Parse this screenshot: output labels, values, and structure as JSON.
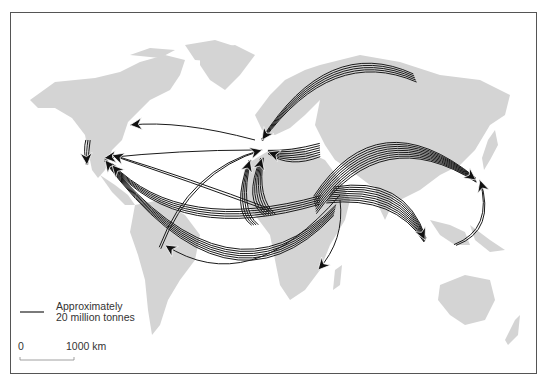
{
  "figure": {
    "type": "flow-map",
    "land_color": "#d4d4d4",
    "flow_color": "#1a1a1a",
    "frame_color": "#555555"
  },
  "legend": {
    "line_label_1": "Approximately",
    "line_label_2": "20 million tonnes",
    "tonnes_per_line": 20
  },
  "scale_bar": {
    "start_label": "0",
    "end_label": "1000 km"
  },
  "flows": [
    {
      "name": "russia-to-europe",
      "from": "Russia",
      "to": "Europe",
      "lines": 5
    },
    {
      "name": "middle-east-to-japan",
      "from": "Middle East",
      "to": "Japan",
      "lines": 9
    },
    {
      "name": "middle-east-to-southeast-asia",
      "from": "Middle East",
      "to": "Southeast Asia",
      "lines": 9
    },
    {
      "name": "middle-east-to-europe",
      "from": "Middle East",
      "to": "Europe",
      "lines": 7
    },
    {
      "name": "north-africa-to-europe",
      "from": "North Africa",
      "to": "Europe",
      "lines": 6
    },
    {
      "name": "west-africa-to-europe",
      "from": "West Africa",
      "to": "Europe",
      "lines": 4
    },
    {
      "name": "middle-east-to-usa",
      "from": "Middle East",
      "to": "USA",
      "lines": 6
    },
    {
      "name": "middle-east-to-usa-pacific",
      "from": "Middle East",
      "to": "USA",
      "lines": 5
    },
    {
      "name": "europe-to-canada",
      "from": "Europe",
      "to": "Canada",
      "lines": 1
    },
    {
      "name": "europe-to-usa",
      "from": "Europe",
      "to": "USA",
      "lines": 1
    },
    {
      "name": "west-africa-to-usa",
      "from": "West Africa",
      "to": "USA",
      "lines": 2
    },
    {
      "name": "caribbean-to-europe",
      "from": "Caribbean/South America",
      "to": "Europe",
      "lines": 2
    },
    {
      "name": "middle-east-to-brazil",
      "from": "Middle East",
      "to": "Brazil",
      "lines": 1
    },
    {
      "name": "middle-east-to-southern-africa",
      "from": "Middle East",
      "to": "Southern Africa",
      "lines": 1
    },
    {
      "name": "indonesia-to-japan",
      "from": "Indonesia",
      "to": "Japan",
      "lines": 2
    },
    {
      "name": "alaska-to-us-west-coast",
      "from": "Alaska",
      "to": "US West Coast",
      "lines": 3
    }
  ]
}
